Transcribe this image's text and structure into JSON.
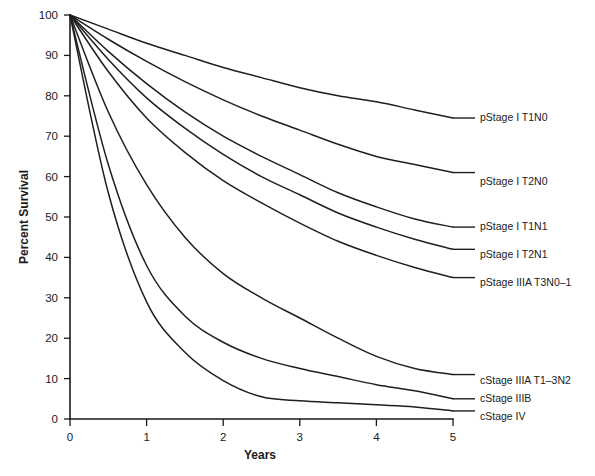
{
  "chart_data": {
    "type": "line",
    "title": "",
    "xlabel": "Years",
    "ylabel": "Percent Survival",
    "xlim": [
      0,
      5
    ],
    "ylim": [
      0,
      100
    ],
    "xticks": [
      "0",
      "1",
      "2",
      "3",
      "4",
      "5"
    ],
    "yticks": [
      "0",
      "10",
      "20",
      "30",
      "40",
      "50",
      "60",
      "70",
      "80",
      "90",
      "100"
    ],
    "grid": false,
    "legend_position": "right-inline-labels",
    "x": [
      0,
      0.5,
      1,
      1.5,
      2,
      2.5,
      3,
      3.5,
      4,
      4.5,
      5
    ],
    "series": [
      {
        "name": "pStage I T1N0",
        "label": "pStage I T1N0",
        "label_y": 74.5,
        "values": [
          100,
          96.5,
          93,
          90,
          87,
          84.5,
          82,
          80,
          78.5,
          76.5,
          74.5
        ]
      },
      {
        "name": "pStage I T2N0",
        "label": "pStage I T2N0",
        "label_y": 61,
        "values": [
          100,
          94,
          88.5,
          83.5,
          79,
          75,
          71.5,
          68,
          65,
          63,
          61
        ]
      },
      {
        "name": "pStage I T1N1",
        "label": "pStage I T1N1",
        "label_y": 47.5,
        "values": [
          100,
          91,
          83,
          76,
          70,
          65,
          60.5,
          56,
          52.5,
          49.5,
          47.5
        ]
      },
      {
        "name": "pStage I T2N1",
        "label": "pStage I T2N1",
        "label_y": 42,
        "values": [
          100,
          89,
          79.5,
          72,
          65.5,
          60,
          55.5,
          51,
          47.5,
          44.5,
          42
        ]
      },
      {
        "name": "pStage IIIA T3N0-1",
        "label": "pStage IIIA T3N0–1",
        "label_y": 35,
        "values": [
          100,
          86,
          74.5,
          66,
          59,
          53.5,
          48.5,
          44,
          40.5,
          37.5,
          35
        ]
      },
      {
        "name": "cStage IIIA T1-3N2",
        "label": "cStage IIIA T1–3N2",
        "label_y": 11,
        "values": [
          100,
          76,
          58,
          45,
          36,
          30,
          25,
          20,
          15.5,
          12.5,
          11
        ]
      },
      {
        "name": "cStage IIIB",
        "label": "cStage IIIB",
        "label_y": 5,
        "values": [
          100,
          63,
          38,
          25.5,
          19,
          15,
          12.5,
          10.5,
          8.5,
          7,
          5
        ]
      },
      {
        "name": "cStage IV",
        "label": "cStage IV",
        "label_y": 2,
        "values": [
          100,
          56,
          29,
          16.5,
          9.5,
          5.5,
          4.5,
          4,
          3.5,
          3,
          2
        ]
      }
    ]
  },
  "axes": {
    "y_title": "Percent Survival",
    "x_title": "Years",
    "y_tick_labels": [
      "100",
      "90",
      "80",
      "70",
      "60",
      "50",
      "40",
      "30",
      "20",
      "10",
      "0"
    ],
    "x_tick_labels": [
      "0",
      "1",
      "2",
      "3",
      "4",
      "5"
    ]
  },
  "labels": {
    "s0": "pStage I T1N0",
    "s1": "pStage I T2N0",
    "s2": "pStage I T1N1",
    "s3": "pStage I T2N1",
    "s4": "pStage IIIA T3N0–1",
    "s5": "cStage IIIA T1–3N2",
    "s6": "cStage IIIB",
    "s7": "cStage IV"
  },
  "colors": {
    "curve": "#1f1f1f",
    "axis": "#1a1a1a",
    "background": "#ffffff"
  }
}
